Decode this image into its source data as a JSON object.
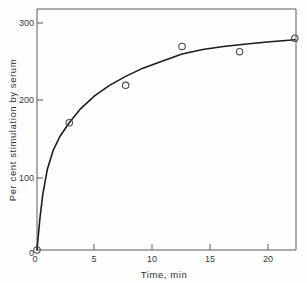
{
  "figure": {
    "background_color": "#fefefe",
    "axis_color": "#5a5a5a",
    "curve_color": "#1d1d1d",
    "marker_color": "#4a4a4a"
  },
  "chart_data": {
    "type": "scatter",
    "title": "",
    "subtitle": "",
    "xlabel": "Time,   min",
    "ylabel": "Per cent stimulation by serum",
    "xlim": [
      0,
      22.5
    ],
    "ylim": [
      0,
      322
    ],
    "grid": false,
    "legend": null,
    "x_ticks": [
      0,
      5,
      10,
      15,
      20
    ],
    "x_tick_labels": [
      "0",
      "5",
      "10",
      "15",
      "20"
    ],
    "y_ticks": [
      0,
      100,
      200,
      300
    ],
    "y_tick_labels": [
      "0",
      "100",
      "200",
      "300"
    ],
    "series": [
      {
        "name": "Per cent stimulation by serum",
        "marker": "open-circle",
        "x": [
          0,
          2.8,
          7.7,
          12.6,
          17.6,
          22.4
        ],
        "y": [
          0,
          170,
          220,
          272,
          265,
          283
        ]
      }
    ],
    "fit_curve": {
      "name": "fitted saturation curve",
      "x": [
        0,
        0.25,
        0.5,
        0.9,
        1.4,
        2.0,
        2.8,
        3.8,
        5.0,
        6.3,
        7.7,
        9.2,
        10.8,
        12.6,
        14.4,
        16.2,
        18.0,
        20.0,
        22.4
      ],
      "y": [
        0,
        42,
        74,
        108,
        133,
        152,
        170,
        189,
        206,
        220,
        232,
        243,
        252,
        262,
        268,
        272,
        275,
        278,
        281
      ]
    }
  },
  "axis_labels": {
    "y_title": "Per cent stimulation by serum",
    "x_title": "Time,   min",
    "y_300": "300",
    "y_200": "200",
    "y_100": "100",
    "y_0": "0",
    "x_0": "0",
    "x_5": "5",
    "x_10": "10",
    "x_15": "15",
    "x_20": "20"
  }
}
